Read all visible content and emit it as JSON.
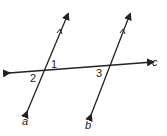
{
  "diagram": {
    "lines": [
      {
        "id": "a",
        "label": "a",
        "parallel_mark": true
      },
      {
        "id": "b",
        "label": "b",
        "parallel_mark": true
      },
      {
        "id": "c",
        "label": "c",
        "role": "transversal"
      }
    ],
    "angles": [
      {
        "label": "1",
        "at": "a-c intersection",
        "position": "above-right"
      },
      {
        "label": "2",
        "at": "a-c intersection",
        "position": "below-left"
      },
      {
        "label": "3",
        "at": "b-c intersection",
        "position": "below-left"
      }
    ],
    "stroke_color": "#222222"
  }
}
